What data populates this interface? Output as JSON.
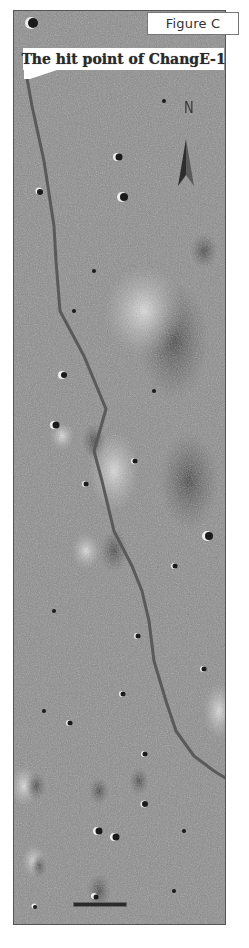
{
  "figure": {
    "label": "Figure C",
    "callout_text": "The hit point of ChangE-1",
    "north_label": "N"
  },
  "map": {
    "subject": "lunar surface image with rille/trail line",
    "colors": {
      "terrain_base": "#8a8a8a",
      "trail": "#5a5a5a",
      "crater_shadow": "#1e1e1e",
      "crater_rim": "#e6e6e6",
      "callout_bg": "#ffffff"
    },
    "trail_points": [
      [
        12,
        62
      ],
      [
        18,
        95
      ],
      [
        30,
        150
      ],
      [
        40,
        215
      ],
      [
        42,
        250
      ],
      [
        46,
        300
      ],
      [
        70,
        345
      ],
      [
        92,
        398
      ],
      [
        80,
        440
      ],
      [
        88,
        470
      ],
      [
        100,
        520
      ],
      [
        118,
        555
      ],
      [
        128,
        580
      ],
      [
        135,
        610
      ],
      [
        140,
        650
      ],
      [
        152,
        690
      ],
      [
        162,
        720
      ],
      [
        180,
        745
      ],
      [
        200,
        760
      ],
      [
        213,
        768
      ]
    ],
    "scale_bar": {
      "visible": true,
      "text": ""
    }
  }
}
